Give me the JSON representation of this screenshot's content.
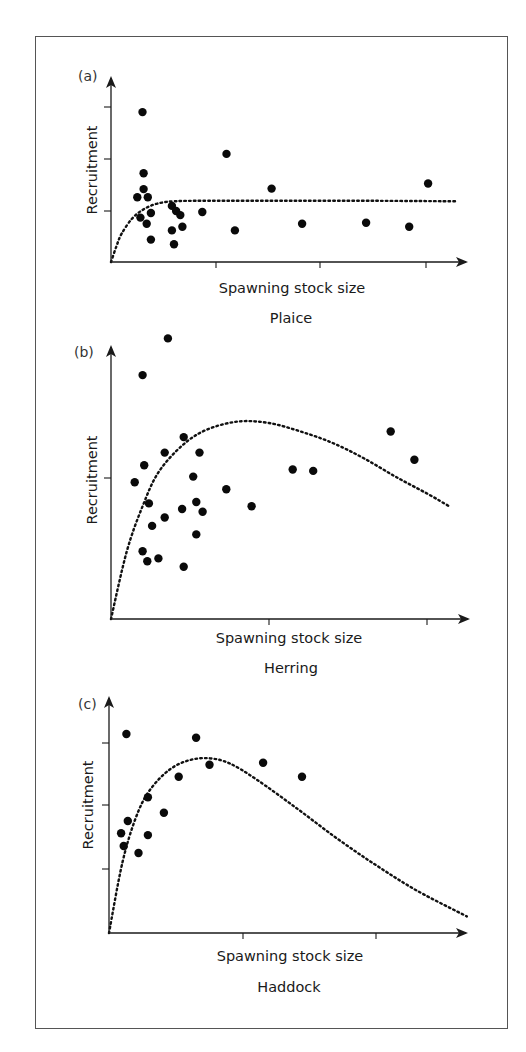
{
  "chart_data": [
    {
      "type": "scatter",
      "panel_label": "(a)",
      "title": "Plaice",
      "xlabel": "Spawning stock size",
      "ylabel": "Recruitment",
      "grid": false,
      "legend": null,
      "axis_pixels": {
        "origin": [
          111,
          262
        ],
        "x_end": 468,
        "y_top": 76
      },
      "x_ticks_px": [
        216,
        320,
        426
      ],
      "y_ticks_px": [
        107,
        159,
        211
      ],
      "xlim": [
        0,
        3.4
      ],
      "ylim": [
        0,
        3.6
      ],
      "x_tick_values": [
        1,
        2,
        3
      ],
      "y_tick_values": [
        1,
        2,
        3
      ],
      "points": [
        {
          "x": 0.3,
          "y": 2.94
        },
        {
          "x": 1.1,
          "y": 2.12
        },
        {
          "x": 1.53,
          "y": 1.44
        },
        {
          "x": 0.31,
          "y": 1.74
        },
        {
          "x": 0.31,
          "y": 1.43
        },
        {
          "x": 0.25,
          "y": 1.27
        },
        {
          "x": 0.35,
          "y": 1.27
        },
        {
          "x": 0.38,
          "y": 0.96
        },
        {
          "x": 0.28,
          "y": 0.87
        },
        {
          "x": 0.34,
          "y": 0.75
        },
        {
          "x": 0.38,
          "y": 0.44
        },
        {
          "x": 0.58,
          "y": 1.1
        },
        {
          "x": 0.62,
          "y": 1.0
        },
        {
          "x": 0.66,
          "y": 0.92
        },
        {
          "x": 0.58,
          "y": 0.62
        },
        {
          "x": 0.68,
          "y": 0.69
        },
        {
          "x": 0.6,
          "y": 0.35
        },
        {
          "x": 0.87,
          "y": 0.98
        },
        {
          "x": 1.18,
          "y": 0.62
        },
        {
          "x": 1.82,
          "y": 0.75
        },
        {
          "x": 2.43,
          "y": 0.77
        },
        {
          "x": 2.84,
          "y": 0.69
        },
        {
          "x": 3.02,
          "y": 1.54
        }
      ],
      "fit_curve": {
        "model": "Beverton-Holt (asymptotic)",
        "style": "dotted",
        "points": [
          [
            0,
            0
          ],
          [
            0.05,
            0.3
          ],
          [
            0.1,
            0.55
          ],
          [
            0.2,
            0.85
          ],
          [
            0.3,
            1.02
          ],
          [
            0.4,
            1.12
          ],
          [
            0.5,
            1.17
          ],
          [
            0.6,
            1.19
          ],
          [
            0.8,
            1.2
          ],
          [
            1.5,
            1.2
          ],
          [
            2.5,
            1.2
          ],
          [
            3.3,
            1.19
          ]
        ]
      }
    },
    {
      "type": "scatter",
      "panel_label": "(b)",
      "title": "Herring",
      "xlabel": "Spawning stock size",
      "ylabel": "Recruitment",
      "grid": false,
      "legend": null,
      "axis_pixels": {
        "origin": [
          111,
          619
        ],
        "x_end": 470,
        "y_top": 345
      },
      "x_ticks_px": [
        269,
        427
      ],
      "y_ticks_px": [
        478
      ],
      "xlim": [
        0,
        2.3
      ],
      "ylim": [
        0,
        1.95
      ],
      "x_tick_values": [
        1,
        2
      ],
      "y_tick_values": [
        1
      ],
      "points": [
        {
          "x": 0.36,
          "y": 1.99
        },
        {
          "x": 0.2,
          "y": 1.73
        },
        {
          "x": 0.46,
          "y": 1.29
        },
        {
          "x": 0.34,
          "y": 1.18
        },
        {
          "x": 0.56,
          "y": 1.18
        },
        {
          "x": 0.21,
          "y": 1.09
        },
        {
          "x": 0.15,
          "y": 0.97
        },
        {
          "x": 0.52,
          "y": 1.01
        },
        {
          "x": 0.73,
          "y": 0.92
        },
        {
          "x": 0.24,
          "y": 0.82
        },
        {
          "x": 0.54,
          "y": 0.83
        },
        {
          "x": 0.45,
          "y": 0.78
        },
        {
          "x": 0.58,
          "y": 0.76
        },
        {
          "x": 0.34,
          "y": 0.72
        },
        {
          "x": 0.26,
          "y": 0.66
        },
        {
          "x": 0.54,
          "y": 0.6
        },
        {
          "x": 0.2,
          "y": 0.48
        },
        {
          "x": 0.23,
          "y": 0.41
        },
        {
          "x": 0.3,
          "y": 0.43
        },
        {
          "x": 0.46,
          "y": 0.37
        },
        {
          "x": 0.89,
          "y": 0.8
        },
        {
          "x": 1.15,
          "y": 1.06
        },
        {
          "x": 1.28,
          "y": 1.05
        },
        {
          "x": 1.77,
          "y": 1.33
        },
        {
          "x": 1.92,
          "y": 1.13
        }
      ],
      "fit_curve": {
        "model": "Ricker (dome-shaped)",
        "style": "dotted",
        "points": [
          [
            0,
            0
          ],
          [
            0.1,
            0.48
          ],
          [
            0.2,
            0.8
          ],
          [
            0.3,
            1.04
          ],
          [
            0.45,
            1.23
          ],
          [
            0.6,
            1.34
          ],
          [
            0.8,
            1.4
          ],
          [
            1.0,
            1.39
          ],
          [
            1.2,
            1.33
          ],
          [
            1.4,
            1.25
          ],
          [
            1.6,
            1.14
          ],
          [
            1.8,
            1.01
          ],
          [
            2.0,
            0.89
          ],
          [
            2.14,
            0.8
          ]
        ]
      }
    },
    {
      "type": "scatter",
      "panel_label": "(c)",
      "title": "Haddock",
      "xlabel": "Spawning stock size",
      "ylabel": "Recruitment",
      "grid": false,
      "legend": null,
      "axis_pixels": {
        "origin": [
          109,
          933
        ],
        "x_end": 468,
        "y_top": 696
      },
      "x_ticks_px": [
        243,
        376
      ],
      "y_ticks_px": [
        869,
        805,
        743
      ],
      "xlim": [
        0,
        2.7
      ],
      "ylim": [
        0,
        3.7
      ],
      "x_tick_values": [
        1,
        2
      ],
      "y_tick_values": [
        1,
        2,
        3
      ],
      "points": [
        {
          "x": 0.13,
          "y": 3.11
        },
        {
          "x": 0.65,
          "y": 3.05
        },
        {
          "x": 0.75,
          "y": 2.63
        },
        {
          "x": 1.15,
          "y": 2.66
        },
        {
          "x": 1.44,
          "y": 2.44
        },
        {
          "x": 0.52,
          "y": 2.44
        },
        {
          "x": 0.29,
          "y": 2.12
        },
        {
          "x": 0.41,
          "y": 1.88
        },
        {
          "x": 0.14,
          "y": 1.75
        },
        {
          "x": 0.09,
          "y": 1.56
        },
        {
          "x": 0.29,
          "y": 1.53
        },
        {
          "x": 0.11,
          "y": 1.36
        },
        {
          "x": 0.22,
          "y": 1.25
        }
      ],
      "fit_curve": {
        "model": "Ricker (dome-shaped, strong decline)",
        "style": "dotted",
        "points": [
          [
            0,
            0
          ],
          [
            0.1,
            1.1
          ],
          [
            0.2,
            1.8
          ],
          [
            0.3,
            2.22
          ],
          [
            0.45,
            2.55
          ],
          [
            0.6,
            2.7
          ],
          [
            0.75,
            2.73
          ],
          [
            0.9,
            2.65
          ],
          [
            1.1,
            2.4
          ],
          [
            1.4,
            1.95
          ],
          [
            1.7,
            1.48
          ],
          [
            2.0,
            1.05
          ],
          [
            2.3,
            0.66
          ],
          [
            2.67,
            0.26
          ]
        ]
      }
    }
  ]
}
